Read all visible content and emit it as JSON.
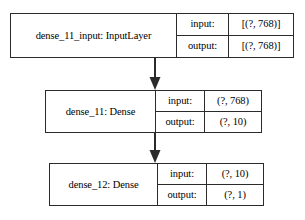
{
  "diagram": {
    "type": "keras-model-graph",
    "orientation": "top-to-bottom",
    "background_color": "#ffffff",
    "border_color": "#2b2b2b",
    "text_color": "#000000",
    "column_headers": {
      "input": "input:",
      "output": "output:"
    },
    "nodes": [
      {
        "id": "dense_11_input",
        "name": "dense_11_input: InputLayer",
        "input_label": "input:",
        "input_shape": "[(?, 768)]",
        "output_label": "output:",
        "output_shape": "[(?, 768)]"
      },
      {
        "id": "dense_11",
        "name": "dense_11: Dense",
        "input_label": "input:",
        "input_shape": "(?, 768)",
        "output_label": "output:",
        "output_shape": "(?, 10)"
      },
      {
        "id": "dense_12",
        "name": "dense_12: Dense",
        "input_label": "input:",
        "input_shape": "(?, 10)",
        "output_label": "output:",
        "output_shape": "(?, 1)"
      }
    ],
    "edges": [
      {
        "from": "dense_11_input",
        "to": "dense_11"
      },
      {
        "from": "dense_11",
        "to": "dense_12"
      }
    ]
  }
}
